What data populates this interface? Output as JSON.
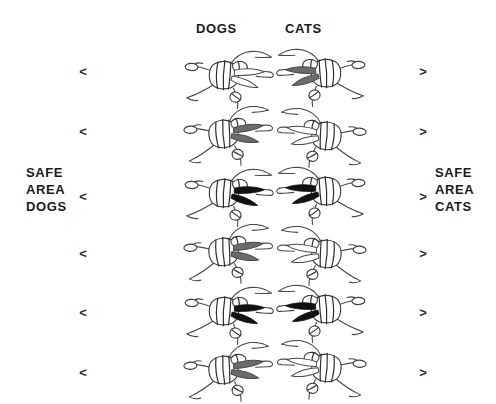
{
  "page": {
    "background_color": "#ffffff",
    "width": 496,
    "height": 404
  },
  "columns": {
    "left_header": "DOGS",
    "right_header": "CATS"
  },
  "side_labels": {
    "left": {
      "line1": "SAFE",
      "line2": "AREA",
      "line3": "DOGS"
    },
    "right": {
      "line1": "SAFE",
      "line2": "AREA",
      "line3": "CATS"
    }
  },
  "markers": {
    "left_glyph": "<",
    "right_glyph": ">",
    "rows": [
      {
        "top": 65
      },
      {
        "top": 125
      },
      {
        "top": 190
      },
      {
        "top": 247
      },
      {
        "top": 306
      },
      {
        "top": 366
      }
    ]
  },
  "colors": {
    "ink": "#1a1a1a",
    "outline": "#4a4a4a",
    "shade_gray": "#6b6b6b",
    "shade_black": "#111111"
  },
  "figures": {
    "description": "skydiver-figure",
    "rows": 6,
    "cols": 2,
    "grid": [
      {
        "row": 1,
        "col": "dogs",
        "shade": "none",
        "left": 182,
        "top": 48,
        "name": "figure-dogs-1"
      },
      {
        "row": 1,
        "col": "cats",
        "shade": "gray",
        "left": 272,
        "top": 46,
        "name": "figure-cats-1"
      },
      {
        "row": 2,
        "col": "dogs",
        "shade": "gray",
        "left": 182,
        "top": 106,
        "name": "figure-dogs-2"
      },
      {
        "row": 2,
        "col": "cats",
        "shade": "none",
        "left": 272,
        "top": 108,
        "name": "figure-cats-2"
      },
      {
        "row": 3,
        "col": "dogs",
        "shade": "black",
        "left": 182,
        "top": 166,
        "name": "figure-dogs-3"
      },
      {
        "row": 3,
        "col": "cats",
        "shade": "black",
        "left": 272,
        "top": 164,
        "name": "figure-cats-3"
      },
      {
        "row": 4,
        "col": "dogs",
        "shade": "gray",
        "left": 182,
        "top": 224,
        "name": "figure-dogs-4"
      },
      {
        "row": 4,
        "col": "cats",
        "shade": "none",
        "left": 272,
        "top": 226,
        "name": "figure-cats-4"
      },
      {
        "row": 5,
        "col": "dogs",
        "shade": "black",
        "left": 182,
        "top": 284,
        "name": "figure-dogs-5"
      },
      {
        "row": 5,
        "col": "cats",
        "shade": "black",
        "left": 272,
        "top": 282,
        "name": "figure-cats-5"
      },
      {
        "row": 6,
        "col": "dogs",
        "shade": "gray",
        "left": 182,
        "top": 342,
        "name": "figure-dogs-6"
      },
      {
        "row": 6,
        "col": "cats",
        "shade": "none",
        "left": 272,
        "top": 340,
        "name": "figure-cats-6"
      }
    ]
  }
}
